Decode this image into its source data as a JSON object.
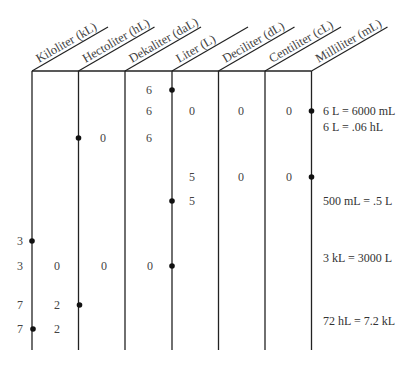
{
  "diagram": {
    "columns": [
      {
        "name": "Kiloliter (kL)"
      },
      {
        "name": "Hectoliter (hL)"
      },
      {
        "name": "Dekaliter (daL)"
      },
      {
        "name": "Liter (L)"
      },
      {
        "name": "Deciliter (dL)"
      },
      {
        "name": "Centiliter (cL)"
      },
      {
        "name": "Milliliter (mL)"
      }
    ],
    "rows": [
      {
        "digits": [
          {
            "col": 2,
            "value": "6"
          }
        ],
        "point_after_col": 2,
        "equation": ""
      },
      {
        "digits": [
          {
            "col": 2,
            "value": "6"
          },
          {
            "col": 3,
            "value": "0"
          },
          {
            "col": 4,
            "value": "0"
          },
          {
            "col": 5,
            "value": "0"
          }
        ],
        "point_after_col": 5,
        "equation": "6 L = 6000 mL"
      },
      {
        "digits": [],
        "point_after_col": null,
        "equation": "6 L = .06 hL"
      },
      {
        "digits": [
          {
            "col": 1,
            "value": "0"
          },
          {
            "col": 2,
            "value": "6"
          }
        ],
        "point_after_col": 0,
        "equation": ""
      },
      {
        "digits": [
          {
            "col": 3,
            "value": "5"
          },
          {
            "col": 4,
            "value": "0"
          },
          {
            "col": 5,
            "value": "0"
          }
        ],
        "point_after_col": 5,
        "equation": ""
      },
      {
        "digits": [
          {
            "col": 3,
            "value": "5"
          }
        ],
        "point_after_col": 2,
        "equation": "500 mL = .5 L"
      },
      {
        "digits": [
          {
            "col": -1,
            "value": "3"
          }
        ],
        "point_after_col": -1,
        "equation": ""
      },
      {
        "digits": [
          {
            "col": -1,
            "value": "3"
          },
          {
            "col": 0,
            "value": "0"
          },
          {
            "col": 1,
            "value": "0"
          },
          {
            "col": 2,
            "value": "0"
          }
        ],
        "point_after_col": 2,
        "equation": "3 kL = 3000 L"
      },
      {
        "digits": [
          {
            "col": -1,
            "value": "7"
          },
          {
            "col": 0,
            "value": "2"
          }
        ],
        "point_after_col": 0,
        "equation": ""
      },
      {
        "digits": [
          {
            "col": -1,
            "value": "7"
          },
          {
            "col": 0,
            "value": "2"
          }
        ],
        "point_after_col": -1,
        "equation": "72 hL = 7.2 kL"
      }
    ],
    "labels": {
      "h0": "Kiloliter (kL)",
      "h1": "Hectoliter (hL)",
      "h2": "Dekaliter (daL)",
      "h3": "Liter (L)",
      "h4": "Deciliter (dL)",
      "h5": "Centiliter (cL)",
      "h6": "Milliliter (mL)",
      "eq1": "6 L = 6000 mL",
      "eq2": "6 L = .06 hL",
      "eq3": "500 mL = .5 L",
      "eq4": "3 kL = 3000 L",
      "eq5": "72 hL = 7.2 kL",
      "r1c2": "6",
      "r2c2": "6",
      "r2c3": "0",
      "r2c4": "0",
      "r2c5": "0",
      "r3c1": "0",
      "r3c2": "6",
      "r4c3": "5",
      "r4c4": "0",
      "r4c5": "0",
      "r5c3": "5",
      "r6c0": "3",
      "r7c0": "3",
      "r7c1": "0",
      "r7c2": "0",
      "r7c3": "0",
      "r8c0": "7",
      "r8c1": "2",
      "r9c0": "7",
      "r9c1": "2"
    },
    "colors": {
      "line": "#222222",
      "text": "#444444",
      "point": "#111111"
    }
  }
}
